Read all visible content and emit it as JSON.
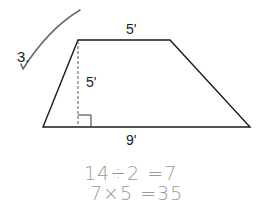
{
  "problem": {
    "number": "3.",
    "check_mark": true
  },
  "figure": {
    "shape": "trapezoid",
    "labels": {
      "top_base": "5'",
      "height": "5'",
      "bottom_base": "9'"
    },
    "measurements": {
      "top_base_ft": 5,
      "height_ft": 5,
      "bottom_base_ft": 9
    },
    "height_line_style": "dashed",
    "right_angle_marker": true
  },
  "work": {
    "line1": "14÷2 =7",
    "line2": "7×5 =35"
  },
  "colors": {
    "figure_stroke": "#1a1a1a",
    "check_mark": "#6a6a6a",
    "handwriting": "#9a9a9a"
  }
}
